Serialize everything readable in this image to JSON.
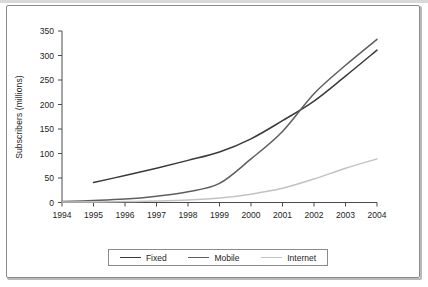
{
  "chart_data": {
    "type": "line",
    "title": "",
    "xlabel": "",
    "ylabel": "Subscribers (millions)",
    "xlim": [
      1994,
      2004
    ],
    "ylim": [
      0,
      350
    ],
    "grid": false,
    "legend_position": "bottom",
    "x": [
      1994,
      1995,
      1996,
      1997,
      1998,
      1999,
      2000,
      2001,
      2002,
      2003,
      2004
    ],
    "xticklabels": [
      "1994",
      "1995",
      "1996",
      "1997",
      "1998",
      "1999",
      "2000",
      "2001",
      "2002",
      "2003",
      "2004"
    ],
    "yticks": [
      0,
      50,
      100,
      150,
      200,
      250,
      300,
      350
    ],
    "yticklabels": [
      "0",
      "50",
      "100",
      "150",
      "200",
      "250",
      "300",
      "350"
    ],
    "series": [
      {
        "name": "Fixed",
        "color": "#3a3a3a",
        "x": [
          1995,
          1996,
          1997,
          1998,
          1999,
          2000,
          2001,
          2002,
          2003,
          2004
        ],
        "values": [
          41,
          55,
          70,
          86,
          103,
          130,
          167,
          207,
          258,
          311
        ]
      },
      {
        "name": "Mobile",
        "color": "#5e5e5e",
        "x": [
          1994,
          1995,
          1996,
          1997,
          1998,
          1999,
          2000,
          2001,
          2002,
          2003,
          2004
        ],
        "values": [
          2,
          4,
          7,
          13,
          22,
          39,
          89,
          145,
          222,
          280,
          333
        ]
      },
      {
        "name": "Internet",
        "color": "#c2c2c2",
        "x": [
          1994,
          1995,
          1996,
          1997,
          1998,
          1999,
          2000,
          2001,
          2002,
          2003,
          2004
        ],
        "values": [
          1,
          1,
          2,
          3,
          5,
          9,
          17,
          29,
          48,
          70,
          89
        ]
      }
    ]
  },
  "legend": {
    "items": [
      {
        "label": "Fixed",
        "color": "#3a3a3a"
      },
      {
        "label": "Mobile",
        "color": "#5e5e5e"
      },
      {
        "label": "Internet",
        "color": "#c2c2c2"
      }
    ]
  },
  "axis": {
    "y_title": "Subscribers (millions)"
  }
}
